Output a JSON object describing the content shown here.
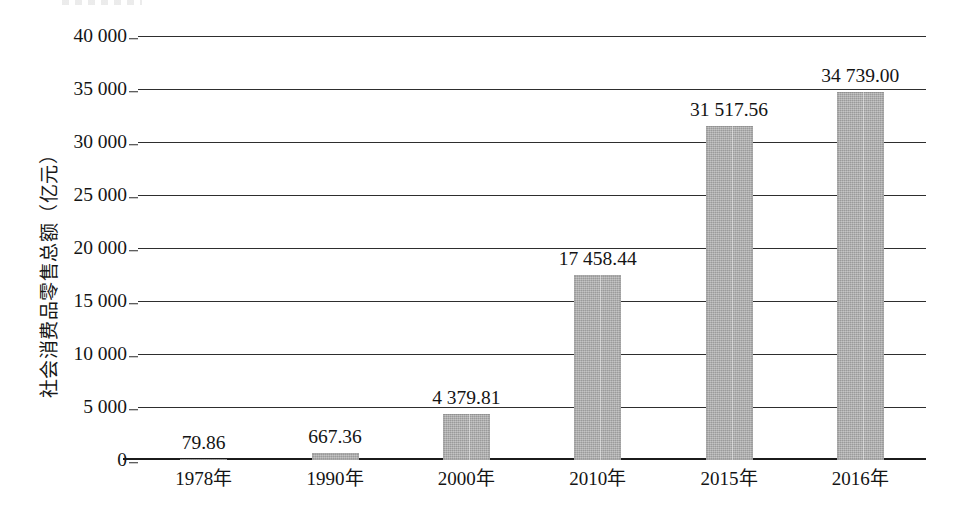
{
  "chart_data": {
    "type": "bar",
    "title": "",
    "xlabel": "",
    "ylabel": "社会消费品零售总额（亿元）",
    "categories": [
      "1978年",
      "1990年",
      "2000年",
      "2010年",
      "2015年",
      "2016年"
    ],
    "values": [
      79.86,
      667.36,
      4379.81,
      17458.44,
      31517.56,
      34739.0
    ],
    "value_labels": [
      "79.86",
      "667.36",
      "4 379.81",
      "17 458.44",
      "31 517.56",
      "34 739.00"
    ],
    "ylim": [
      0,
      40000
    ],
    "ytick_values": [
      0,
      5000,
      10000,
      15000,
      20000,
      25000,
      30000,
      35000,
      40000
    ],
    "ytick_labels": [
      "0",
      "5 000",
      "10 000",
      "15 000",
      "20 000",
      "25 000",
      "30 000",
      "35 000",
      "40 000"
    ],
    "grid": true,
    "legend": "none",
    "series": [
      {
        "name": "社会消费品零售总额",
        "values": [
          79.86,
          667.36,
          4379.81,
          17458.44,
          31517.56,
          34739.0
        ]
      }
    ],
    "bar_color": "#ababab",
    "axis_color": "#2e2e2e",
    "text_color": "#141414"
  },
  "axis": {
    "y_title": "社会消费品零售总额（亿元）"
  }
}
